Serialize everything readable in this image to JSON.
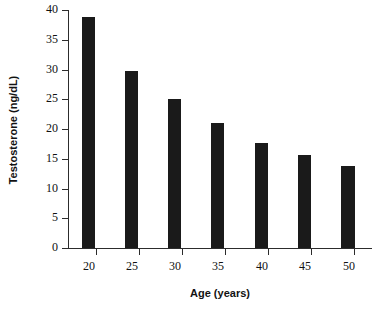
{
  "chart_data": {
    "type": "bar",
    "title": "",
    "xlabel": "Age (years)",
    "ylabel": "Testosterone (ng/dL)",
    "categories": [
      "20",
      "25",
      "30",
      "35",
      "40",
      "45",
      "50"
    ],
    "values": [
      38.8,
      29.7,
      25.1,
      21.0,
      17.7,
      15.6,
      13.8
    ],
    "ylim": [
      0,
      40
    ],
    "yticks": [
      0,
      5,
      10,
      15,
      20,
      25,
      30,
      35,
      40
    ],
    "ytick_labels": [
      "0",
      "5",
      "10",
      "15",
      "20",
      "25",
      "30",
      "35",
      "40"
    ],
    "xtick_labels": [
      "20",
      "25",
      "30",
      "35",
      "40",
      "45",
      "50"
    ],
    "grid": false,
    "legend": false,
    "bar_color": "#1a1a1a",
    "axis_color": "#2c2c2c",
    "background_color": "#ffffff"
  }
}
